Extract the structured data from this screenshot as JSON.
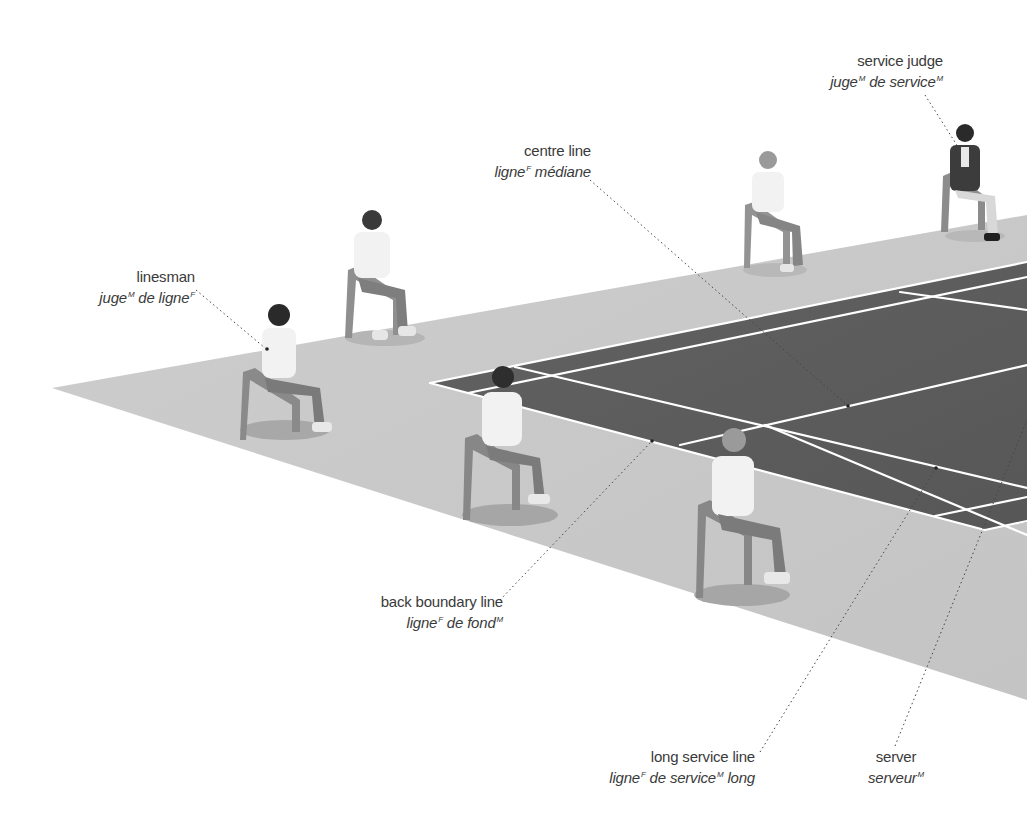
{
  "diagram": {
    "colors": {
      "floor": "#c9c9c9",
      "court": "#5f5f5f",
      "lines": "#ffffff",
      "label_text": "#3a3a3a",
      "leader": "#444444"
    },
    "labels": {
      "service_judge": {
        "en": "service judge",
        "fr_parts": [
          {
            "t": "juge",
            "g": "M"
          },
          {
            "t": " de service",
            "g": "M"
          }
        ]
      },
      "centre_line": {
        "en": "centre line",
        "fr_parts": [
          {
            "t": "ligne",
            "g": "F"
          },
          {
            "t": " médiane",
            "g": ""
          }
        ]
      },
      "linesman": {
        "en": "linesman",
        "fr_parts": [
          {
            "t": "juge",
            "g": "M"
          },
          {
            "t": " de ligne",
            "g": "F"
          }
        ]
      },
      "back_boundary_line": {
        "en": "back boundary line",
        "fr_parts": [
          {
            "t": "ligne",
            "g": "F"
          },
          {
            "t": " de fond",
            "g": "M"
          }
        ]
      },
      "long_service_line": {
        "en": "long service line",
        "fr_parts": [
          {
            "t": "ligne",
            "g": "F"
          },
          {
            "t": " de service",
            "g": "M"
          },
          {
            "t": " long",
            "g": ""
          }
        ]
      },
      "server": {
        "en": "server",
        "fr_parts": [
          {
            "t": "serveur",
            "g": "M"
          }
        ]
      }
    }
  }
}
